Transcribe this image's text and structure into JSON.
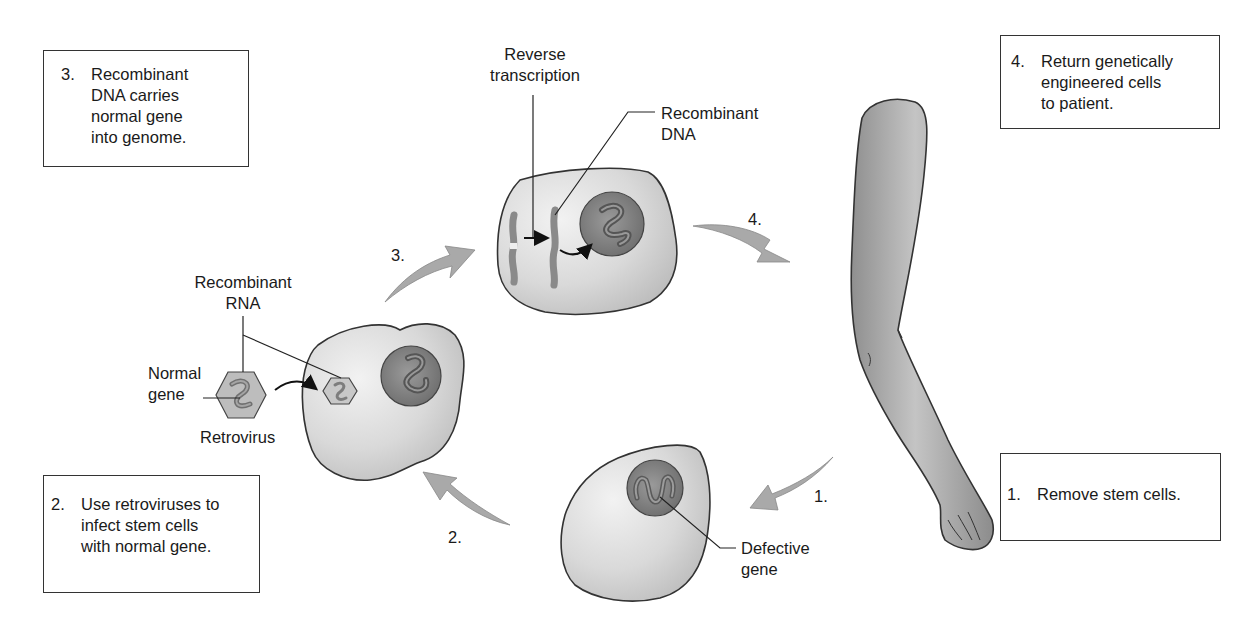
{
  "diagram": {
    "colors": {
      "background": "#ffffff",
      "outline": "#333333",
      "cell_fill": "#d4d4d4",
      "cell_highlight": "#ececec",
      "nucleus_fill": "#8a8a8a",
      "arrow_fill": "#a9a9a9",
      "arm_fill": "#a6a6a6",
      "text": "#1a1a1a"
    },
    "step_boxes": [
      {
        "number": "3.",
        "text": "Recombinant\nDNA carries\nnormal gene\ninto genome."
      },
      {
        "number": "4.",
        "text": "Return genetically\nengineered cells\nto patient."
      },
      {
        "number": "1.",
        "text": "Remove stem cells."
      },
      {
        "number": "2.",
        "text": "Use retroviruses to\ninfect stem cells\nwith normal gene."
      }
    ],
    "arrow_labels": {
      "step1": "1.",
      "step2": "2.",
      "step3": "3.",
      "step4": "4."
    },
    "labels": {
      "reverse_transcription": "Reverse\ntranscription",
      "recombinant_dna": "Recombinant\nDNA",
      "recombinant_rna": "Recombinant\nRNA",
      "normal_gene": "Normal\ngene",
      "retrovirus": "Retrovirus",
      "defective_gene": "Defective\ngene"
    }
  }
}
